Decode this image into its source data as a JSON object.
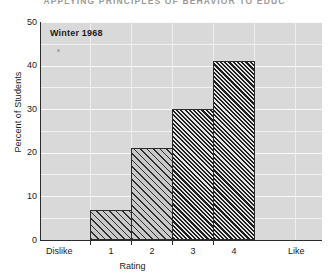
{
  "page": {
    "running_head": "APPLYING PRINCIPLES OF BEHAVIOR TO EDUC"
  },
  "chart_data": {
    "type": "bar",
    "title": "",
    "annotation": "Winter 1968",
    "categories": [
      "1",
      "2",
      "3",
      "4"
    ],
    "values": [
      7,
      21,
      30,
      41
    ],
    "xlabel": "Rating",
    "ylabel": "Percent of Students",
    "ylim": [
      0,
      50
    ],
    "yticks": [
      0,
      10,
      20,
      30,
      40,
      50
    ],
    "ytick_labels": [
      "0",
      "10",
      "20",
      "30",
      "40",
      "50"
    ],
    "gridline_interval": 5,
    "grid": true,
    "legend": "none",
    "x_endpoint_low": "Dislike",
    "x_endpoint_high": "Like",
    "bar_styles": [
      "light-hatch",
      "light-hatch",
      "dark-hatch",
      "dark-hatch"
    ],
    "colors": {
      "plot_background": "#d9d9d9",
      "gridline": "#f2f2f2",
      "bar_outline": "#2b2b2b",
      "bar_light_fill": "#c9c9c9",
      "bar_dark_fill": "#8e8e8e",
      "text": "#1b1b1b"
    }
  }
}
